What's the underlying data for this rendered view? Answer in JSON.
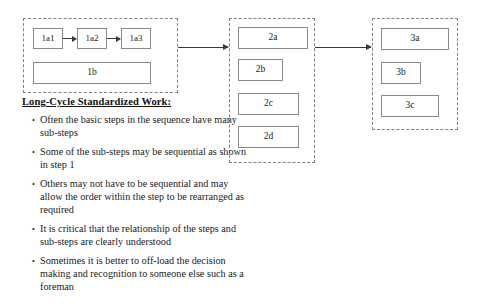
{
  "diagram": {
    "groups": [
      {
        "name": "step-1-group",
        "boxes": [
          {
            "label": "1a1"
          },
          {
            "label": "1a2"
          },
          {
            "label": "1a3"
          },
          {
            "label": "1b"
          }
        ]
      },
      {
        "name": "step-2-group",
        "boxes": [
          {
            "label": "2a"
          },
          {
            "label": "2b"
          },
          {
            "label": "2c"
          },
          {
            "label": "2d"
          }
        ]
      },
      {
        "name": "step-3-group",
        "boxes": [
          {
            "label": "3a"
          },
          {
            "label": "3b"
          },
          {
            "label": "3c"
          }
        ]
      }
    ],
    "colors": {
      "box_border": "#8a8a8a",
      "group_border": "#808080",
      "arrow": "#3a3a3a",
      "text": "#1a1a1a",
      "background": "#ffffff"
    }
  },
  "notes": {
    "title": "Long-Cycle Standardized Work:",
    "bullets": [
      "Often the basic steps in the sequence have many sub-steps",
      "Some of the sub-steps may be sequential as shown in step 1",
      "Others may not have to be sequential and may allow the order within the step to be rearranged as required",
      "It is critical that the relationship of the steps and sub-steps are clearly understood",
      "Sometimes it is better to off-load the decision making and recognition to someone else such as a foreman"
    ]
  }
}
